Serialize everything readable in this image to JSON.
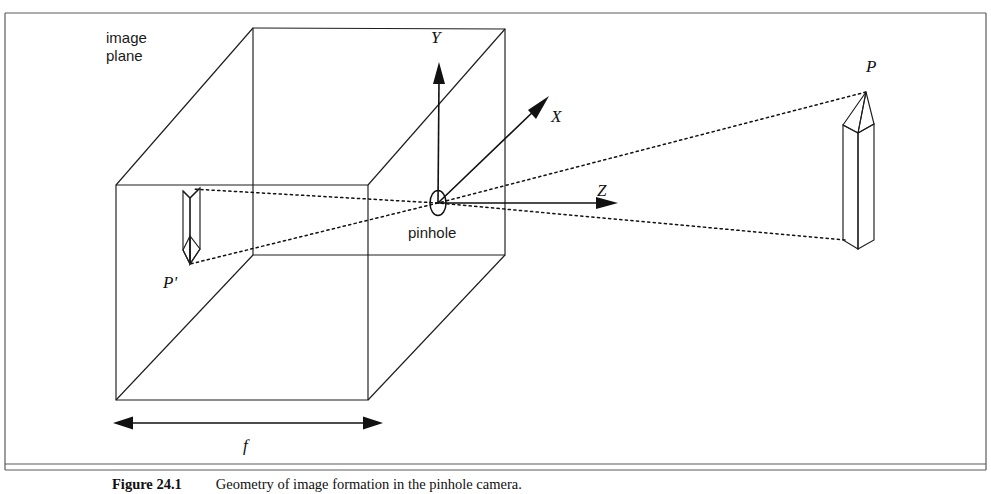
{
  "figure": {
    "type": "diagram",
    "labels": {
      "image_plane_line1": "image",
      "image_plane_line2": "plane",
      "pinhole": "pinhole",
      "axis_x": "X",
      "axis_y": "Y",
      "axis_z": "Z",
      "object_point": "P",
      "image_point": "P'",
      "focal_length": "f"
    },
    "caption": {
      "number": "Figure 24.1",
      "text": "Geometry of image formation in the pinhole camera."
    },
    "colors": {
      "ink": "#1d1d1d",
      "frame": "#5b5b5b",
      "background": "#ffffff"
    },
    "geometry": {
      "frame": {
        "x": 5,
        "y": 13,
        "width": 981,
        "height": 457
      },
      "box_front_face": {
        "left": 116,
        "right": 368,
        "top": 185,
        "bottom": 400
      },
      "box_back_face": {
        "left": 253,
        "right": 505,
        "top": 28,
        "bottom": 255
      },
      "pinhole_center": {
        "x": 438,
        "y": 203
      },
      "object_tip": {
        "x": 866,
        "y": 92
      },
      "object_base": {
        "x": 845,
        "y": 240
      },
      "focal_arrow": {
        "y": 423,
        "x1": 118,
        "x2": 378
      }
    }
  }
}
